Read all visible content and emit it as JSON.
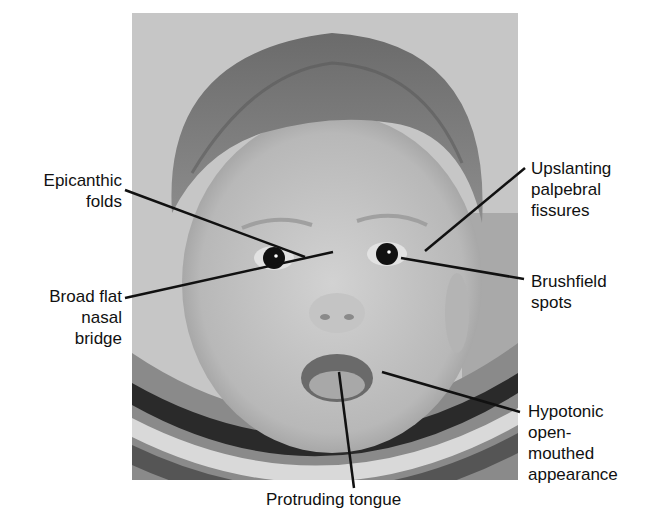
{
  "figure": {
    "labels": [
      {
        "id": "epicanthic",
        "text": "Epicanthic\nfolds"
      },
      {
        "id": "nasal-bridge",
        "text": "Broad flat\nnasal\nbridge"
      },
      {
        "id": "upslanting",
        "text": "Upslanting\npalpebral\nfissures"
      },
      {
        "id": "brushfield",
        "text": "Brushfield\nspots"
      },
      {
        "id": "hypotonic",
        "text": "Hypotonic\nopen-\nmouthed\nappearance"
      },
      {
        "id": "tongue",
        "text": "Protruding tongue"
      }
    ],
    "caption": "",
    "colors": {
      "line": "#111111",
      "background": "#ffffff",
      "text": "#111111"
    }
  }
}
